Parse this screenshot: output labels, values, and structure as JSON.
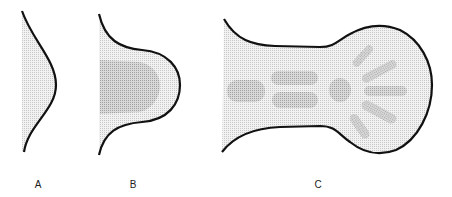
{
  "figure": {
    "panels": [
      {
        "id": "A",
        "label": "A",
        "stage": "early limb bud"
      },
      {
        "id": "B",
        "label": "B",
        "stage": "paddle-shaped limb bud with mesenchymal condensation"
      },
      {
        "id": "C",
        "label": "C",
        "stage": "limb with cartilage condensations and digit rays"
      }
    ]
  },
  "colors": {
    "outline": "#111111",
    "tissue_fill": "#e4e4e4",
    "condensation_fill": "#bdbdbd",
    "background": "#ffffff"
  }
}
